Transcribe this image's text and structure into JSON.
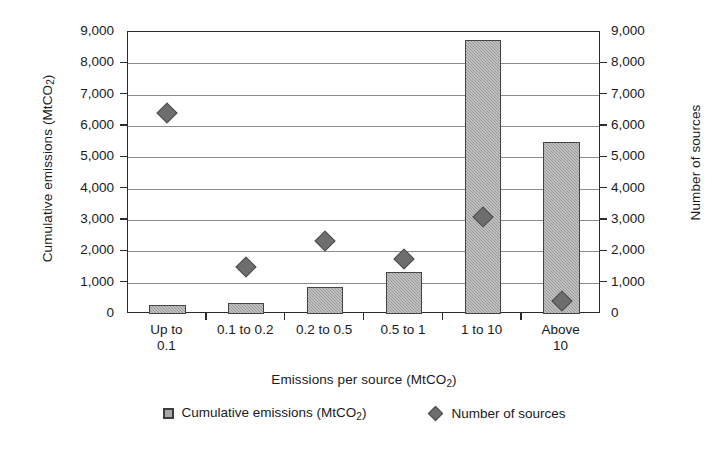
{
  "chart_data": {
    "type": "bar",
    "title": "",
    "xlabel": "Emissions per source (MtCO2)",
    "ylabel": "Cumulative emissions (MtCO2)",
    "ylabel_secondary": "Number of sources",
    "categories": [
      "Up to 0.1",
      "0.1 to 0.2",
      "0.2 to 0.5",
      "0.5 to 1",
      "1 to 10",
      "Above 10"
    ],
    "ylim": [
      0,
      9000
    ],
    "ylim_secondary": [
      0,
      9000
    ],
    "grid": true,
    "legend_position": "bottom",
    "series": [
      {
        "name": "Cumulative emissions (MtCO2)",
        "type": "bar",
        "axis": "left",
        "color": "#9a9a9a",
        "values": [
          280,
          350,
          850,
          1350,
          8750,
          5500
        ]
      },
      {
        "name": "Number of sources",
        "type": "scatter",
        "axis": "right",
        "marker": "diamond",
        "color": "#6e6e6e",
        "values": [
          6400,
          1500,
          2320,
          1750,
          3100,
          400
        ]
      }
    ],
    "y_ticks": [
      0,
      1000,
      2000,
      3000,
      4000,
      5000,
      6000,
      7000,
      8000,
      9000
    ],
    "y_tick_labels": [
      "0",
      "1,000",
      "2,000",
      "3,000",
      "4,000",
      "5,000",
      "6,000",
      "7,000",
      "8,000",
      "9,000"
    ],
    "y_ticks_secondary": [
      0,
      1000,
      2000,
      3000,
      4000,
      5000,
      6000,
      7000,
      8000,
      9000
    ],
    "y_tick_labels_secondary": [
      "0",
      "1,000",
      "2,000",
      "3,000",
      "4,000",
      "5,000",
      "6,000",
      "7,000",
      "8,000",
      "9,000"
    ]
  },
  "axis_titles": {
    "left_main": "Cumulative emissions (MtCO",
    "left_sub": "2",
    "left_tail": ")",
    "right": "Number of sources",
    "x_main": "Emissions per source (MtCO",
    "x_sub": "2",
    "x_tail": ")"
  },
  "x_tick_labels": [
    "Up to\n0.1",
    "0.1 to 0.2",
    "0.2 to 0.5",
    "0.5 to 1",
    "1 to 10",
    "Above\n10"
  ],
  "legend": {
    "items": [
      {
        "label_main": "Cumulative emissions (MtCO",
        "label_sub": "2",
        "label_tail": ")",
        "marker": "square-swatch"
      },
      {
        "label_main": "Number of sources",
        "label_sub": "",
        "label_tail": "",
        "marker": "diamond-swatch"
      }
    ]
  }
}
